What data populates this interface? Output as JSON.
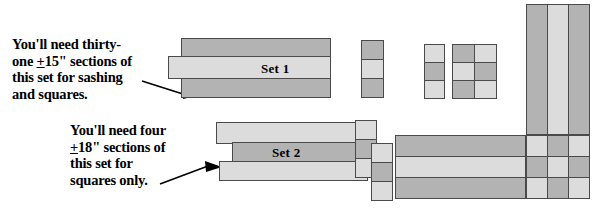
{
  "diagram": {
    "colors": {
      "dark_fabric": "#b3b3b3",
      "light_fabric": "#dcdcdc",
      "outline": "#4a4a4a",
      "text": "#000000",
      "background": "#ffffff"
    },
    "callouts": [
      {
        "id": "callout-sashing",
        "lines": [
          "You'll need thirty-",
          "one +15\" sections of",
          "this set for sashing",
          "and squares."
        ],
        "line1": "You'll need thirty-",
        "line2_pre": "one ",
        "line2_underlined": "+",
        "line2_post": "15\" sections of",
        "line3": "this set for sashing",
        "line4": "and squares.",
        "points_to": "Set 1"
      },
      {
        "id": "callout-squares",
        "lines": [
          "You'll need four",
          "+18\" sections of",
          "this set for",
          "squares only."
        ],
        "line1": "You'll need four",
        "line2_underlined": "+",
        "line2_post": "18\" sections of",
        "line3": "this set for",
        "line4": "squares only.",
        "points_to": "Set 2"
      }
    ],
    "strip_sets": [
      {
        "id": "set-1",
        "label": "Set 1",
        "strips": [
          {
            "position": "top",
            "fabric": "dark"
          },
          {
            "position": "middle",
            "fabric": "light"
          },
          {
            "position": "bottom",
            "fabric": "dark"
          }
        ]
      },
      {
        "id": "set-2",
        "label": "Set 2",
        "strips": [
          {
            "position": "top",
            "fabric": "light"
          },
          {
            "position": "middle",
            "fabric": "dark"
          },
          {
            "position": "bottom",
            "fabric": "light"
          }
        ]
      }
    ],
    "cut_sections": [
      {
        "id": "section-a",
        "source": "Set 1",
        "rows": [
          "dark",
          "light",
          "dark"
        ],
        "columns": 1
      },
      {
        "id": "section-b",
        "source": "Set 2",
        "rows": [
          "light",
          "dark",
          "light"
        ],
        "columns": 1
      },
      {
        "id": "nine-patch-2x3",
        "source": "Set 1 + Set 2",
        "grid": [
          [
            "dark",
            "light"
          ],
          [
            "light",
            "dark"
          ],
          [
            "dark",
            "light"
          ]
        ]
      },
      {
        "id": "section-c",
        "source": "Set 2",
        "rows": [
          "light",
          "dark",
          "light"
        ],
        "columns": 1
      },
      {
        "id": "section-d",
        "source": "Set 2",
        "rows": [
          "light",
          "dark",
          "light"
        ],
        "columns": 1
      },
      {
        "id": "sashing-band",
        "source": "Set 1",
        "rows": [
          "dark",
          "light",
          "dark"
        ],
        "orientation": "horizontal"
      },
      {
        "id": "sashing-column",
        "source": "Set 1",
        "columns": [
          "dark",
          "light",
          "dark"
        ],
        "orientation": "vertical"
      },
      {
        "id": "nine-patch-3x3",
        "source": "Set 1 + Set 2",
        "grid": [
          [
            "light",
            "dark",
            "light"
          ],
          [
            "dark",
            "light",
            "dark"
          ],
          [
            "light",
            "dark",
            "light"
          ]
        ]
      }
    ]
  }
}
